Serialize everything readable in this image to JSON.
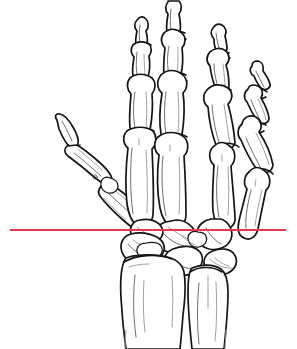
{
  "figure": {
    "view": "Palmar view of right hand skeleton",
    "background_color": "#ffffff",
    "line_color": "#141414",
    "canvas": {
      "width": 297,
      "height": 349
    }
  },
  "reference_line": {
    "label": "Wrist reference line",
    "color": "#e8384f",
    "thickness_px": 2,
    "y": 230,
    "x_start": 10,
    "x_end": 286,
    "orientation": "horizontal",
    "crosses": "radiocarpal joint / proximal carpal row"
  },
  "anatomy": {
    "regions": [
      {
        "name": "distal-phalanges",
        "label": "Distal phalanges",
        "count": 5
      },
      {
        "name": "middle-phalanges",
        "label": "Middle phalanges",
        "count": 4
      },
      {
        "name": "proximal-phalanges",
        "label": "Proximal phalanges",
        "count": 5
      },
      {
        "name": "metacarpals",
        "label": "Metacarpals",
        "count": 5
      },
      {
        "name": "carpals",
        "label": "Carpal bones",
        "count": 8
      },
      {
        "name": "radius",
        "label": "Radius",
        "count": 1
      },
      {
        "name": "ulna",
        "label": "Ulna",
        "count": 1
      }
    ],
    "digits": [
      {
        "name": "thumb",
        "label": "Thumb (digit I)"
      },
      {
        "name": "index-finger",
        "label": "Index finger (digit II)"
      },
      {
        "name": "middle-finger",
        "label": "Middle finger (digit III)"
      },
      {
        "name": "ring-finger",
        "label": "Ring finger (digit IV)"
      },
      {
        "name": "little-finger",
        "label": "Little finger (digit V)"
      }
    ]
  }
}
